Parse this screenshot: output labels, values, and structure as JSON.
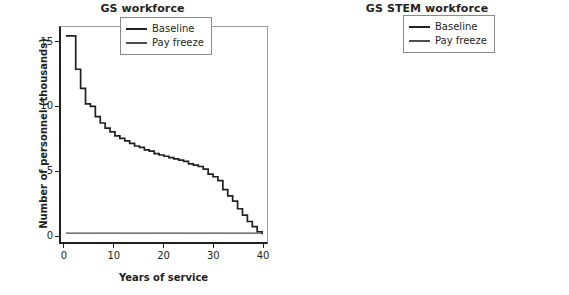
{
  "figure": {
    "background_color": "#ffffff",
    "panel_count": 2
  },
  "panels": [
    {
      "id": "gs-workforce",
      "title": "GS workforce",
      "xlabel": "Years of service",
      "ylabel": "Number of personnel (thousands)",
      "xticks": [
        "0",
        "10",
        "20",
        "30",
        "40"
      ],
      "yticks": [
        "0",
        "5",
        "10",
        "15"
      ],
      "legend": [
        {
          "label": "Baseline",
          "color": "#231f20"
        },
        {
          "label": "Pay freeze",
          "color": "#4d4d4d"
        }
      ]
    },
    {
      "id": "gs-stem-workforce",
      "title": "GS STEM workforce",
      "xlabel": "Years of service",
      "ylabel": "",
      "xticks": [
        "0",
        "10",
        "20",
        "30",
        "40"
      ],
      "yticks": [
        "0",
        "2",
        "4",
        "6",
        "8",
        "10",
        "12",
        "14"
      ],
      "legend": [
        {
          "label": "Baseline",
          "color": "#231f20"
        },
        {
          "label": "Pay freeze",
          "color": "#4d4d4d"
        }
      ]
    }
  ],
  "chart_data": [
    {
      "type": "line",
      "subtype": "step",
      "title": "GS workforce",
      "xlabel": "Years of service",
      "ylabel": "Number of personnel (thousands)",
      "xlim": [
        -1,
        41
      ],
      "ylim": [
        -0.6,
        16.2
      ],
      "xticks": [
        0,
        10,
        20,
        30,
        40
      ],
      "yticks": [
        0,
        5,
        10,
        15
      ],
      "grid": false,
      "legend_position": "upper right",
      "x": [
        0,
        1,
        2,
        3,
        4,
        5,
        6,
        7,
        8,
        9,
        10,
        11,
        12,
        13,
        14,
        15,
        16,
        17,
        18,
        19,
        20,
        21,
        22,
        23,
        24,
        25,
        26,
        27,
        28,
        29,
        30,
        31,
        32,
        33,
        34,
        35,
        36,
        37,
        38,
        39,
        40
      ],
      "series": [
        {
          "name": "Baseline",
          "color": "#231f20",
          "values": [
            15.5,
            15.5,
            12.9,
            11.4,
            10.2,
            10.0,
            9.2,
            8.7,
            8.3,
            8.0,
            7.7,
            7.5,
            7.3,
            7.1,
            6.9,
            6.8,
            6.6,
            6.5,
            6.3,
            6.2,
            6.1,
            6.0,
            5.9,
            5.8,
            5.7,
            5.5,
            5.4,
            5.3,
            5.1,
            4.7,
            4.5,
            4.2,
            3.5,
            3.0,
            2.6,
            2.0,
            1.5,
            1.0,
            0.6,
            0.2,
            0.0
          ]
        },
        {
          "name": "Pay freeze",
          "color": "#4d4d4d",
          "values": [
            0.1,
            0.1,
            0.1,
            0.1,
            0.1,
            0.1,
            0.1,
            0.1,
            0.1,
            0.1,
            0.1,
            0.1,
            0.1,
            0.1,
            0.1,
            0.1,
            0.1,
            0.1,
            0.1,
            0.1,
            0.1,
            0.1,
            0.1,
            0.1,
            0.1,
            0.1,
            0.1,
            0.1,
            0.1,
            0.1,
            0.1,
            0.1,
            0.1,
            0.1,
            0.1,
            0.1,
            0.1,
            0.1,
            0.1,
            0.1,
            0.1
          ]
        }
      ]
    },
    {
      "type": "line",
      "subtype": "step",
      "title": "GS STEM workforce",
      "xlabel": "Years of service",
      "ylabel": "",
      "xlim": [
        -1,
        41
      ],
      "ylim": [
        -0.55,
        14.5
      ],
      "xticks": [
        0,
        10,
        20,
        30,
        40
      ],
      "yticks": [
        0,
        2,
        4,
        6,
        8,
        10,
        12,
        14
      ],
      "grid": false,
      "legend_position": "upper right",
      "x": [
        0,
        1,
        2,
        3,
        4,
        5,
        6,
        7,
        8,
        9,
        10,
        11,
        12,
        13,
        14,
        15,
        16,
        17,
        18,
        19,
        20,
        21,
        22,
        23,
        24,
        25,
        26,
        27,
        28,
        29,
        30,
        31,
        32,
        33,
        34,
        35,
        36,
        37,
        38,
        39,
        40
      ],
      "series": [
        {
          "name": "Baseline",
          "color": "#231f20",
          "values": [
            13.5,
            13.5,
            11.7,
            10.4,
            9.4,
            8.6,
            8.3,
            7.8,
            7.5,
            7.2,
            7.0,
            6.8,
            6.6,
            6.5,
            6.3,
            6.2,
            6.1,
            6.0,
            5.9,
            5.8,
            5.7,
            5.6,
            5.5,
            5.4,
            5.3,
            5.2,
            5.1,
            5.0,
            5.0,
            4.5,
            4.3,
            4.0,
            3.3,
            2.9,
            2.4,
            1.9,
            1.4,
            0.9,
            0.5,
            0.2,
            0.0
          ]
        },
        {
          "name": "Pay freeze",
          "color": "#4d4d4d",
          "values": [
            0.1,
            0.1,
            0.1,
            0.1,
            0.1,
            0.1,
            0.1,
            0.1,
            0.1,
            0.1,
            0.1,
            0.1,
            0.1,
            0.1,
            0.1,
            0.1,
            0.1,
            0.1,
            0.1,
            0.1,
            0.1,
            0.1,
            0.1,
            0.1,
            0.1,
            0.1,
            0.1,
            0.1,
            0.1,
            0.1,
            0.1,
            0.1,
            0.1,
            0.1,
            0.1,
            0.1,
            0.1,
            0.1,
            0.1,
            0.1,
            0.1
          ]
        }
      ]
    }
  ]
}
